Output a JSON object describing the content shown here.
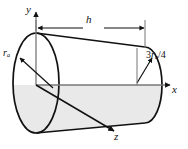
{
  "figure": {
    "type": "technical-diagram",
    "background_color": "#ffffff",
    "line_color": "#111111",
    "shade_color": "#e8e8e8",
    "axes": {
      "y_label": "y",
      "x_label": "x",
      "z_label": "z",
      "origin": {
        "x": 36,
        "y": 85
      }
    },
    "dimensions": {
      "length_label": "h",
      "left_radius_label": {
        "symbol": "r",
        "subscript": "a",
        "full": "ra"
      },
      "right_radius_label": {
        "numerator": "3",
        "symbol": "r",
        "subscript": "a",
        "divider": "/",
        "denominator": "4",
        "full": "3ra/4"
      }
    },
    "geometry": {
      "left_ellipse": {
        "cx": 36,
        "cy": 83,
        "rx": 23,
        "ry": 50
      },
      "right_ellipse": {
        "cx": 145,
        "cy": 85,
        "rx": 17,
        "ry": 38
      },
      "dimension_line_y": 28,
      "dimension_line_x1": 37,
      "dimension_line_x2": 145
    }
  }
}
